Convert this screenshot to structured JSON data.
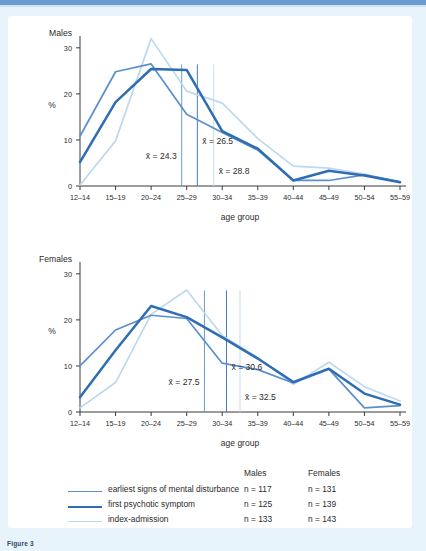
{
  "figure": {
    "caption": "Figure 3",
    "accent_top_bar": "#6b9bd2",
    "page_background": "#e8f4fb",
    "card_background": "#ffffff"
  },
  "legend": {
    "col_headers": [
      "Males",
      "Females"
    ],
    "entries": [
      {
        "label": "earliest signs of mental disturbance",
        "color": "#5b8fcc",
        "width": 1.8,
        "males_n": "n = 117",
        "females_n": "n = 131"
      },
      {
        "label": "first psychotic symptom",
        "color": "#2e6db4",
        "width": 2.6,
        "males_n": "n = 125",
        "females_n": "n = 139"
      },
      {
        "label": "index-admission",
        "color": "#bcd9f0",
        "width": 1.8,
        "males_n": "n = 133",
        "females_n": "n = 143"
      }
    ]
  },
  "chart_data": [
    {
      "type": "line",
      "title": "Males",
      "xlabel": "age group",
      "ylabel": "%",
      "ylim": [
        0,
        33
      ],
      "yticks": [
        0,
        10,
        20,
        30
      ],
      "ytick_labels": [
        "0",
        "10",
        "20",
        "30"
      ],
      "grid": false,
      "legend_position": "below-figure",
      "categories": [
        "12–14",
        "15–19",
        "20–24",
        "25–29",
        "30–34",
        "35–39",
        "40–44",
        "45–49",
        "50–54",
        "55–59"
      ],
      "series": [
        {
          "name": "earliest signs of mental disturbance",
          "color": "#5b8fcc",
          "values": [
            10.8,
            24.8,
            26.5,
            15.6,
            11.6,
            7.8,
            1.2,
            1.2,
            2.4,
            0.9
          ]
        },
        {
          "name": "first psychotic symptom",
          "color": "#2e6db4",
          "values": [
            5.2,
            18.2,
            25.4,
            25.2,
            11.9,
            8.1,
            1.2,
            3.3,
            2.3,
            0.8
          ]
        },
        {
          "name": "index-admission",
          "color": "#bcd9f0",
          "values": [
            0.2,
            9.8,
            32.0,
            20.6,
            18.0,
            10.3,
            4.3,
            3.9,
            2.6,
            0.9
          ]
        }
      ],
      "means": [
        {
          "label": "x̄ = 24.3",
          "value": 24.3,
          "color": "#5b8fcc",
          "label_x": 147,
          "label_y": 182
        },
        {
          "label": "x̄ = 26.5",
          "value": 26.5,
          "color": "#2e6db4",
          "label_x": 176,
          "label_y": 164
        },
        {
          "label": "x̄ = 28.8",
          "value": 28.8,
          "color": "#bcd9f0",
          "label_x": 186,
          "label_y": 199
        }
      ]
    },
    {
      "type": "line",
      "title": "Females",
      "xlabel": "age group",
      "ylabel": "%",
      "ylim": [
        0,
        33
      ],
      "yticks": [
        0,
        10,
        20,
        30
      ],
      "ytick_labels": [
        "0",
        "10",
        "20",
        "30"
      ],
      "grid": false,
      "legend_position": "below-figure",
      "categories": [
        "12–14",
        "15–19",
        "20–24",
        "25–29",
        "30–34",
        "35–39",
        "40–44",
        "45–49",
        "50–54",
        "55–59"
      ],
      "series": [
        {
          "name": "earliest signs of mental disturbance",
          "color": "#5b8fcc",
          "values": [
            10.0,
            17.8,
            21.0,
            20.3,
            10.6,
            9.2,
            6.3,
            9.3,
            0.9,
            1.4
          ]
        },
        {
          "name": "first psychotic symptom",
          "color": "#2e6db4",
          "values": [
            3.2,
            13.4,
            23.0,
            20.6,
            16.2,
            11.6,
            6.5,
            9.4,
            4.0,
            1.6
          ]
        },
        {
          "name": "index-admission",
          "color": "#bcd9f0",
          "values": [
            0.9,
            6.4,
            21.2,
            26.5,
            16.6,
            11.8,
            6.0,
            10.8,
            5.5,
            2.4
          ]
        }
      ],
      "means": [
        {
          "label": "x̄ = 27.5",
          "value": 27.5,
          "color": "#5b8fcc",
          "label_x": 161,
          "label_y": 530
        },
        {
          "label": "x̄ = 30.6",
          "value": 30.6,
          "color": "#2e6db4",
          "label_x": 190,
          "label_y": 512
        },
        {
          "label": "x̄ = 32.5",
          "value": 32.5,
          "color": "#bcd9f0",
          "label_x": 205,
          "label_y": 548
        }
      ]
    }
  ]
}
